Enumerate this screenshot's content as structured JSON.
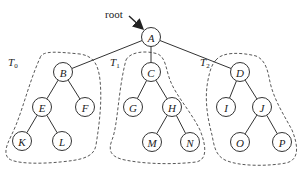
{
  "diagram": {
    "root_label": "root",
    "nodes": [
      {
        "id": "A",
        "label": "A",
        "x": 151,
        "y": 37
      },
      {
        "id": "B",
        "label": "B",
        "x": 63,
        "y": 72
      },
      {
        "id": "C",
        "label": "C",
        "x": 151,
        "y": 72
      },
      {
        "id": "D",
        "label": "D",
        "x": 240,
        "y": 72
      },
      {
        "id": "E",
        "label": "E",
        "x": 42,
        "y": 107
      },
      {
        "id": "F",
        "label": "F",
        "x": 85,
        "y": 107
      },
      {
        "id": "G",
        "label": "G",
        "x": 133,
        "y": 107
      },
      {
        "id": "H",
        "label": "H",
        "x": 172,
        "y": 107
      },
      {
        "id": "I",
        "label": "I",
        "x": 226,
        "y": 107
      },
      {
        "id": "J",
        "label": "J",
        "x": 262,
        "y": 107
      },
      {
        "id": "K",
        "label": "K",
        "x": 22,
        "y": 141
      },
      {
        "id": "L",
        "label": "L",
        "x": 62,
        "y": 141
      },
      {
        "id": "M",
        "label": "M",
        "x": 152,
        "y": 142
      },
      {
        "id": "N",
        "label": "N",
        "x": 190,
        "y": 142
      },
      {
        "id": "O",
        "label": "O",
        "x": 240,
        "y": 142
      },
      {
        "id": "P",
        "label": "P",
        "x": 282,
        "y": 142
      }
    ],
    "edges": [
      [
        "A",
        "B"
      ],
      [
        "A",
        "C"
      ],
      [
        "A",
        "D"
      ],
      [
        "B",
        "E"
      ],
      [
        "B",
        "F"
      ],
      [
        "E",
        "K"
      ],
      [
        "E",
        "L"
      ],
      [
        "C",
        "G"
      ],
      [
        "C",
        "H"
      ],
      [
        "H",
        "M"
      ],
      [
        "H",
        "N"
      ],
      [
        "D",
        "I"
      ],
      [
        "D",
        "J"
      ],
      [
        "J",
        "O"
      ],
      [
        "J",
        "P"
      ]
    ],
    "subtrees": [
      {
        "id": "T0",
        "label": "T",
        "subscript": "0",
        "label_x": 8,
        "label_y": 66
      },
      {
        "id": "T1",
        "label": "T",
        "subscript": "1",
        "label_x": 110,
        "label_y": 66
      },
      {
        "id": "T2",
        "label": "T",
        "subscript": "2",
        "label_x": 200,
        "label_y": 66
      }
    ]
  }
}
